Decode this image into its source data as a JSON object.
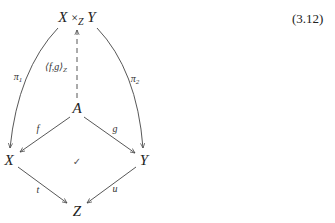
{
  "equation_number": "(3.12)",
  "nodes": {
    "pullback": {
      "left": "X",
      "times": "×",
      "sub": "Z",
      "right": "Y"
    },
    "A": "A",
    "X": "X",
    "Y": "Y",
    "Z": "Z"
  },
  "arrows": {
    "pi1": {
      "label": "π",
      "sub": "1",
      "from": "X ×_Z Y",
      "to": "X",
      "style": "curved-solid"
    },
    "pi2": {
      "label": "π",
      "sub": "2",
      "from": "X ×_Z Y",
      "to": "Y",
      "style": "curved-solid"
    },
    "pairing": {
      "label": "⟨f,g⟩",
      "sub": "Z",
      "from": "A",
      "to": "X ×_Z Y",
      "style": "dashed"
    },
    "f": {
      "label": "f",
      "from": "A",
      "to": "X"
    },
    "g": {
      "label": "g",
      "from": "A",
      "to": "Y"
    },
    "t": {
      "label": "t",
      "from": "X",
      "to": "Z"
    },
    "u": {
      "label": "u",
      "from": "Y",
      "to": "Z"
    }
  },
  "commutes_mark": "✓",
  "colors": {
    "stroke": "#444444",
    "text": "#222222"
  }
}
